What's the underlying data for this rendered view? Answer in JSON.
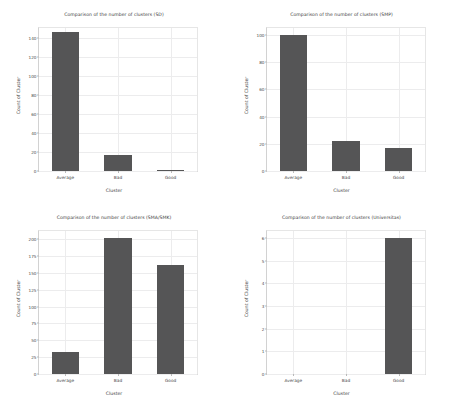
{
  "figure": {
    "background": "#ffffff",
    "bar_color": "#555556",
    "grid_color": "#ececed",
    "text_color": "#3b3b3b"
  },
  "chart_data": [
    {
      "type": "bar",
      "title": "Comparison of the number of clusters (SD)",
      "xlabel": "Cluster",
      "ylabel": "Count of Cluster",
      "categories": [
        "Average",
        "Bad",
        "Good"
      ],
      "values": [
        146,
        17,
        1
      ],
      "ylim": [
        0,
        150
      ],
      "yticks": [
        0,
        20,
        40,
        60,
        80,
        100,
        120,
        140
      ],
      "grid": true,
      "legend": "none"
    },
    {
      "type": "bar",
      "title": "Comparison of the number of clusters (SMP)",
      "xlabel": "Cluster",
      "ylabel": "Count of Cluster",
      "categories": [
        "Average",
        "Bad",
        "Good"
      ],
      "values": [
        100,
        22,
        17
      ],
      "ylim": [
        0,
        105
      ],
      "yticks": [
        0,
        20,
        40,
        60,
        80,
        100
      ],
      "grid": true,
      "legend": "none"
    },
    {
      "type": "bar",
      "title": "Comparison of the number of clusters (SMA/SMK)",
      "xlabel": "Cluster",
      "ylabel": "Count of Cluster",
      "categories": [
        "Average",
        "Bad",
        "Good"
      ],
      "values": [
        33,
        202,
        161
      ],
      "ylim": [
        0,
        212
      ],
      "yticks": [
        0,
        25,
        50,
        75,
        100,
        125,
        150,
        175,
        200
      ],
      "grid": true,
      "legend": "none"
    },
    {
      "type": "bar",
      "title": "Comparison of the number of clusters (Universitas)",
      "xlabel": "Cluster",
      "ylabel": "Count of Cluster",
      "categories": [
        "Average",
        "Bad",
        "Good"
      ],
      "values": [
        0,
        0,
        6
      ],
      "ylim": [
        0,
        6.3
      ],
      "yticks": [
        0,
        1,
        2,
        3,
        4,
        5,
        6
      ],
      "grid": true,
      "legend": "none"
    }
  ]
}
